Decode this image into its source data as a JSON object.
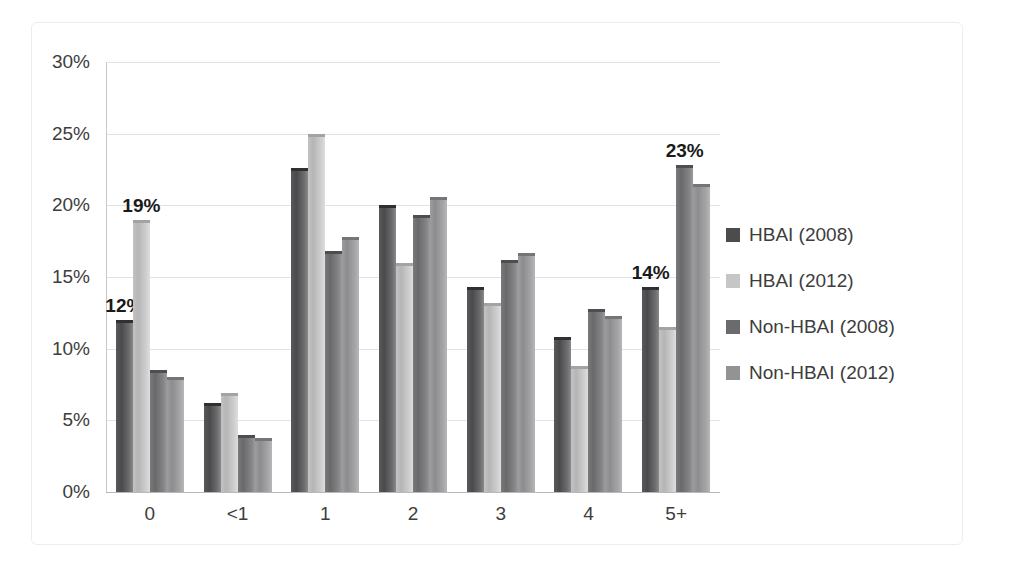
{
  "chart_data": {
    "type": "bar",
    "title": "",
    "subtitle": "",
    "xlabel": "",
    "ylabel": "",
    "categories": [
      "0",
      "<1",
      "1",
      "2",
      "3",
      "4",
      "5+"
    ],
    "ylim": [
      0,
      30
    ],
    "ytick_values": [
      30,
      25,
      20,
      15,
      10,
      5,
      0
    ],
    "ytick_labels": [
      "30%",
      "25%",
      "20%",
      "15%",
      "10%",
      "5%",
      "0%"
    ],
    "grid": true,
    "legend_position": "right",
    "series": [
      {
        "name": "HBAI (2008)",
        "color": "#4c4c4e",
        "values": [
          12.0,
          6.2,
          22.6,
          20.0,
          14.3,
          10.8,
          14.3
        ]
      },
      {
        "name": "HBAI (2012)",
        "color": "#c6c6c7",
        "values": [
          19.0,
          6.9,
          25.0,
          16.0,
          13.2,
          8.8,
          11.5
        ]
      },
      {
        "name": "Non-HBAI (2008)",
        "color": "#6b6b6e",
        "values": [
          8.5,
          4.0,
          16.8,
          19.3,
          16.2,
          12.8,
          22.8
        ]
      },
      {
        "name": "Non-HBAI (2012)",
        "color": "#939396",
        "values": [
          8.0,
          3.8,
          17.8,
          20.6,
          16.7,
          12.3,
          21.5
        ]
      }
    ],
    "data_labels": [
      {
        "category": "0",
        "series": "HBAI (2008)",
        "text": "12%"
      },
      {
        "category": "0",
        "series": "HBAI (2012)",
        "text": "19%"
      },
      {
        "category": "5+",
        "series": "HBAI (2008)",
        "text": "14%"
      },
      {
        "category": "5+",
        "series": "Non-HBAI (2008)",
        "text": "23%"
      }
    ]
  }
}
